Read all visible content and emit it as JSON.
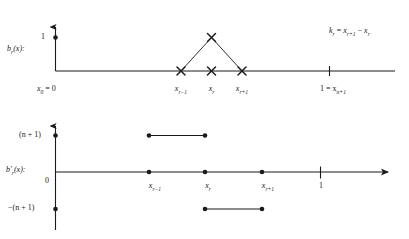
{
  "figure": {
    "title_caption": "",
    "background": "#ffffff",
    "ink": "#1a1a1a"
  },
  "annotation": {
    "spacing_formula": "k_r = x_{r+1} − x_r",
    "parts": {
      "k": "k",
      "k_sub": "r",
      "eq": " = ",
      "x1": "x",
      "x1_sub": "r+1",
      "minus": " − ",
      "x2": "x",
      "x2_sub": "r"
    }
  },
  "top_plot": {
    "name": "hat-basis-function",
    "y_axis_label": "b",
    "y_axis_label_sub": "r",
    "y_axis_label_arg": "(x):",
    "y_ticks": [
      {
        "label": "1",
        "value": 1,
        "marker": "dot"
      }
    ],
    "x_ticks": [
      {
        "label": "x",
        "sub": "0",
        "suffix": " = 0",
        "value": 0,
        "marker": "none"
      },
      {
        "label": "x",
        "sub": "r−1",
        "suffix": "",
        "value": 1,
        "marker": "cross"
      },
      {
        "label": "x",
        "sub": "r",
        "suffix": "",
        "value": 2,
        "marker": "cross"
      },
      {
        "label": "x",
        "sub": "r+1",
        "suffix": "",
        "value": 3,
        "marker": "cross"
      },
      {
        "label": "1 = x",
        "sub": "n+1",
        "suffix": "",
        "value": 4,
        "marker": "tick"
      }
    ],
    "curve": {
      "type": "piecewise-linear-hat",
      "points": [
        {
          "x": "x_{r-1}",
          "y": 0
        },
        {
          "x": "x_r",
          "y": 1
        },
        {
          "x": "x_{r+1}",
          "y": 0
        }
      ],
      "apex_value": 1,
      "apex_marker": "cross"
    }
  },
  "bottom_plot": {
    "name": "hat-basis-derivative",
    "y_axis_label": "b",
    "y_axis_label_prime": "′",
    "y_axis_label_sub": "r",
    "y_axis_label_arg": "(x):",
    "y_ticks": [
      {
        "label": "(n + 1)",
        "value": 1,
        "marker": "dot"
      },
      {
        "label": "0",
        "value": 0,
        "marker": "none"
      },
      {
        "label": "−(n + 1)",
        "value": -1,
        "marker": "dot"
      }
    ],
    "x_ticks": [
      {
        "label": "x",
        "sub": "r−1",
        "suffix": "",
        "value": 1
      },
      {
        "label": "x",
        "sub": "r",
        "suffix": "",
        "value": 2
      },
      {
        "label": "x",
        "sub": "r+1",
        "suffix": "",
        "value": 3
      },
      {
        "label": "1",
        "sub": "",
        "suffix": "",
        "value": 4,
        "marker": "tick"
      }
    ],
    "steps": [
      {
        "level": 0,
        "from": "0",
        "to": "x_{r-1}",
        "endpoint_left": "none",
        "endpoint_right": "dot"
      },
      {
        "level": 1,
        "from": "x_{r-1}",
        "to": "x_r",
        "endpoint_left": "dot",
        "endpoint_right": "dot"
      },
      {
        "level": 0,
        "from": "x_r",
        "to": "x_r",
        "endpoint_left": "dot",
        "endpoint_right": "dot"
      },
      {
        "level": -1,
        "from": "x_r",
        "to": "x_{r+1}",
        "endpoint_left": "dot",
        "endpoint_right": "dot"
      },
      {
        "level": 0,
        "from": "x_{r+1}",
        "to": "axis-end",
        "endpoint_left": "dot",
        "endpoint_right": "arrow"
      }
    ]
  }
}
